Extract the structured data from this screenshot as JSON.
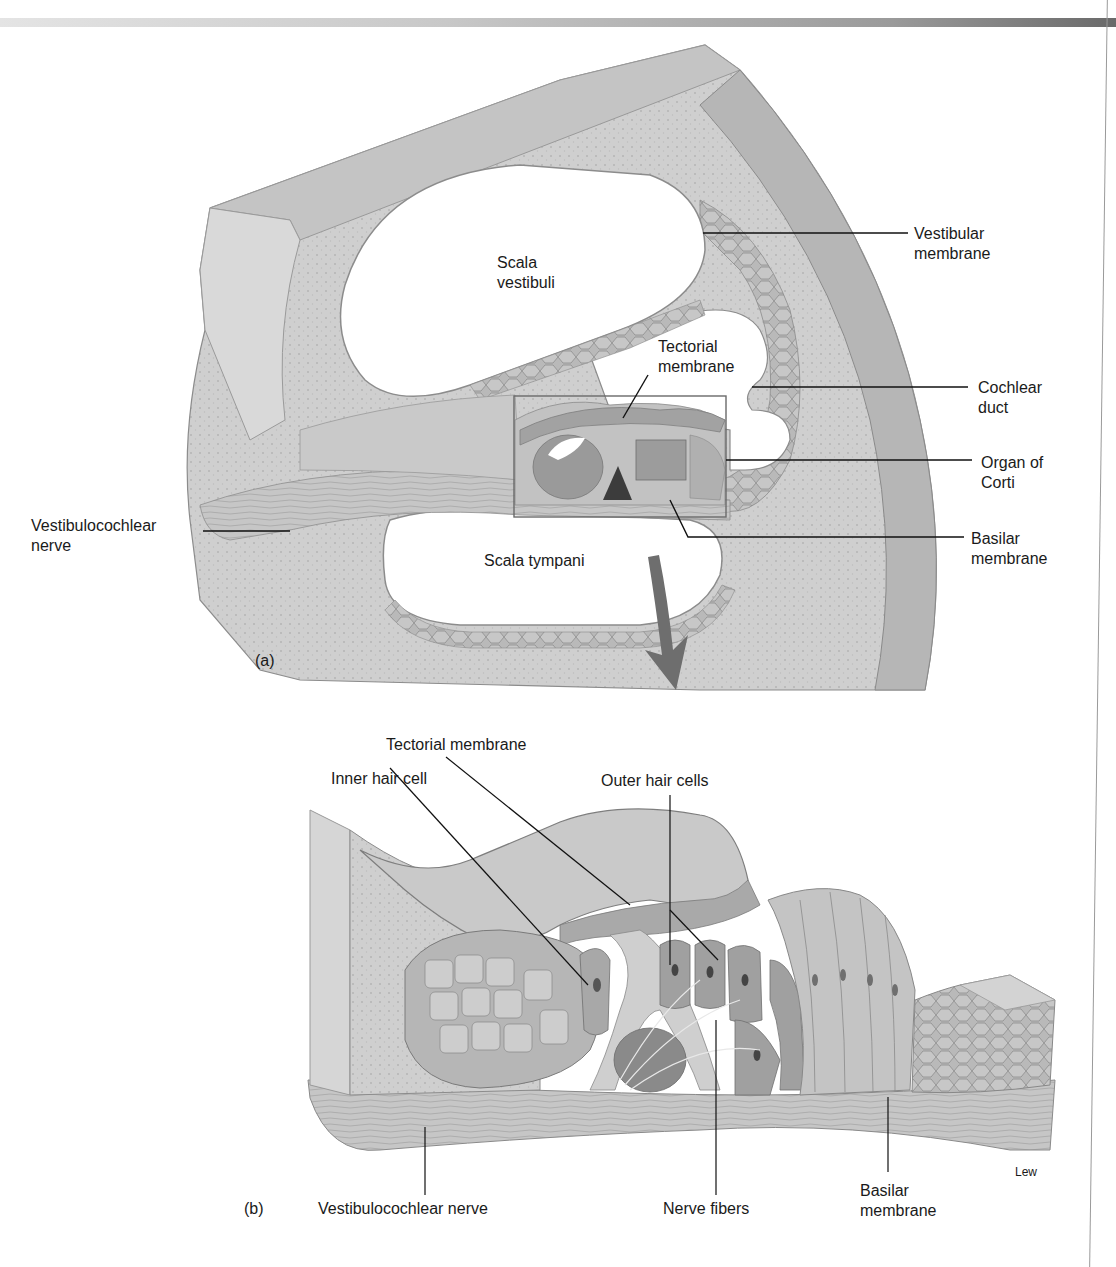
{
  "figure": {
    "panel_a": {
      "panel_label": "(a)",
      "labels": {
        "scala_vestibuli": "Scala\nvestibuli",
        "vestibular_membrane": "Vestibular\nmembrane",
        "tectorial_membrane": "Tectorial\nmembrane",
        "cochlear_duct": "Cochlear\nduct",
        "organ_of_corti": "Organ of\nCorti",
        "basilar_membrane": "Basilar\nmembrane",
        "vestibulocochlear_nerve": "Vestibulocochlear\nnerve",
        "scala_tympani": "Scala tympani"
      }
    },
    "panel_b": {
      "panel_label": "(b)",
      "labels": {
        "tectorial_membrane": "Tectorial membrane",
        "inner_hair_cell": "Inner hair cell",
        "outer_hair_cells": "Outer hair cells",
        "vestibulocochlear_nerve": "Vestibulocochlear nerve",
        "nerve_fibers": "Nerve fibers",
        "basilar_membrane": "Basilar\nmembrane"
      },
      "artist_signature": "Lew"
    },
    "colors": {
      "tissue_light": "#d6d6d6",
      "tissue_mid": "#bdbdbd",
      "tissue_dark": "#8e8e8e",
      "leader_line": "#111111",
      "arrow": "#6e6e6e"
    }
  }
}
